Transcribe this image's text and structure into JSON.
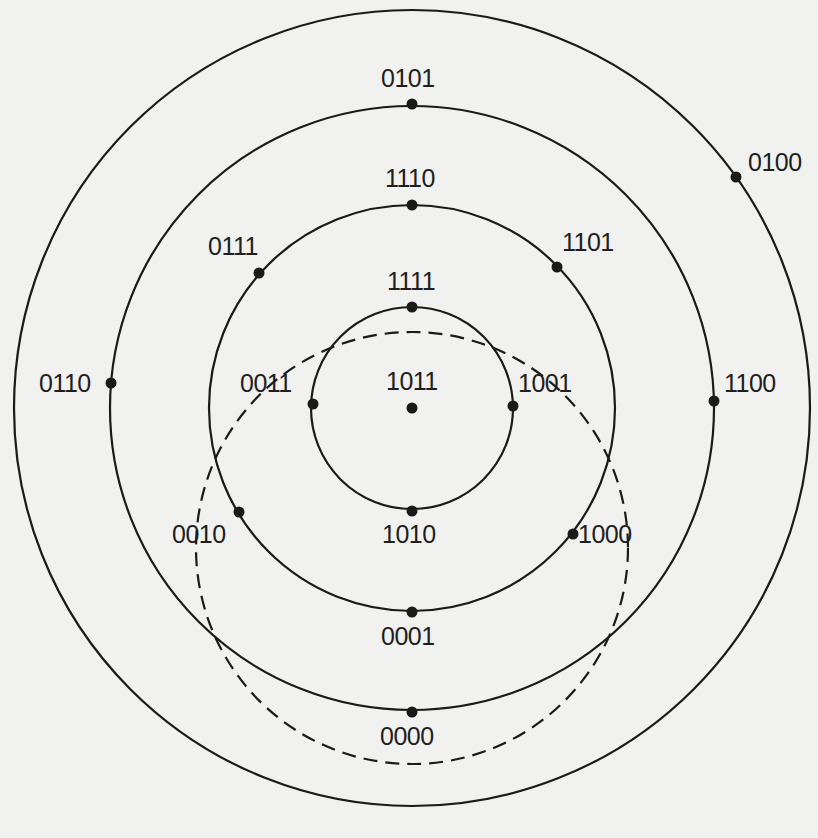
{
  "diagram": {
    "type": "concentric-circles-binary-codes",
    "center": {
      "x": 412,
      "y": 408
    },
    "rings": [
      {
        "name": "ring-outer",
        "r": 398,
        "style": "solid"
      },
      {
        "name": "ring-3",
        "r": 302,
        "style": "solid"
      },
      {
        "name": "ring-2",
        "r": 203,
        "style": "solid"
      },
      {
        "name": "ring-1",
        "r": 101,
        "style": "solid"
      }
    ],
    "dashed_ring": {
      "name": "dashed-ring",
      "cx": 412,
      "cy": 548,
      "r": 216,
      "style": "dashed"
    },
    "nodes": [
      {
        "code": "1011",
        "dot": {
          "x": 412,
          "y": 408
        },
        "label": {
          "x": 386,
          "y": 369
        }
      },
      {
        "code": "1111",
        "dot": {
          "x": 412,
          "y": 307
        },
        "label": {
          "x": 387,
          "y": 269
        }
      },
      {
        "code": "0011",
        "dot": {
          "x": 313,
          "y": 404
        },
        "label": {
          "x": 240,
          "y": 371
        }
      },
      {
        "code": "1001",
        "dot": {
          "x": 513,
          "y": 406
        },
        "label": {
          "x": 518,
          "y": 371
        }
      },
      {
        "code": "1010",
        "dot": {
          "x": 412,
          "y": 511
        },
        "label": {
          "x": 382,
          "y": 522
        }
      },
      {
        "code": "1110",
        "dot": {
          "x": 412,
          "y": 205
        },
        "label": {
          "x": 385,
          "y": 166
        }
      },
      {
        "code": "0111",
        "dot": {
          "x": 259,
          "y": 273
        },
        "label": {
          "x": 208,
          "y": 234
        }
      },
      {
        "code": "1101",
        "dot": {
          "x": 557,
          "y": 267
        },
        "label": {
          "x": 562,
          "y": 230
        }
      },
      {
        "code": "0010",
        "dot": {
          "x": 239,
          "y": 512
        },
        "label": {
          "x": 172,
          "y": 522
        }
      },
      {
        "code": "1000",
        "dot": {
          "x": 573,
          "y": 534
        },
        "label": {
          "x": 578,
          "y": 522
        }
      },
      {
        "code": "0001",
        "dot": {
          "x": 412,
          "y": 612
        },
        "label": {
          "x": 381,
          "y": 624
        }
      },
      {
        "code": "0101",
        "dot": {
          "x": 412,
          "y": 104
        },
        "label": {
          "x": 381,
          "y": 66
        }
      },
      {
        "code": "0110",
        "dot": {
          "x": 111,
          "y": 383
        },
        "label": {
          "x": 39,
          "y": 371
        }
      },
      {
        "code": "1100",
        "dot": {
          "x": 714,
          "y": 401
        },
        "label": {
          "x": 724,
          "y": 371
        }
      },
      {
        "code": "0000",
        "dot": {
          "x": 412,
          "y": 712
        },
        "label": {
          "x": 380,
          "y": 724
        }
      },
      {
        "code": "0100",
        "dot": {
          "x": 736,
          "y": 177
        },
        "label": {
          "x": 748,
          "y": 150
        }
      }
    ]
  }
}
